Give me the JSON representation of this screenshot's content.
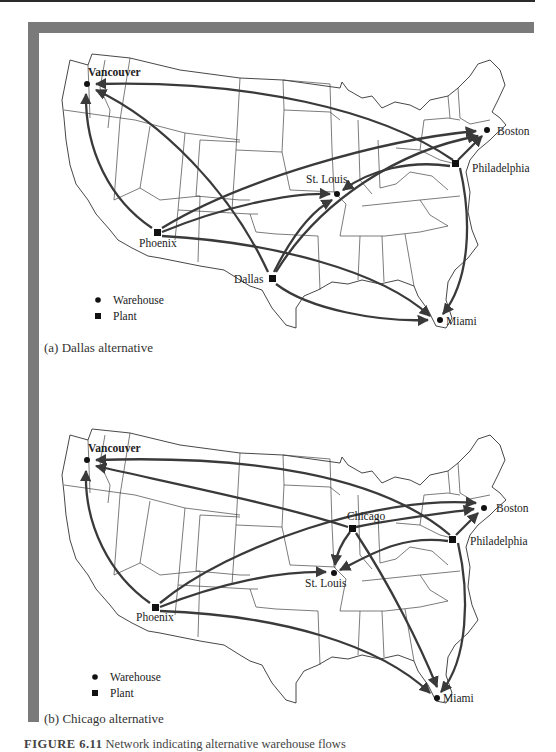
{
  "figure": {
    "number": "FIGURE 6.11",
    "caption_text": "Network indicating alternative warehouse flows"
  },
  "panels": [
    {
      "id": "a",
      "caption": "(a) Dallas alternative",
      "legend": [
        {
          "symbol": "circle",
          "label": "Warehouse"
        },
        {
          "symbol": "square",
          "label": "Plant"
        }
      ],
      "nodes": [
        {
          "name": "Vancouver",
          "type": "warehouse"
        },
        {
          "name": "Boston",
          "type": "warehouse"
        },
        {
          "name": "Philadelphia",
          "type": "plant"
        },
        {
          "name": "St. Louis",
          "type": "warehouse"
        },
        {
          "name": "Phoenix",
          "type": "plant"
        },
        {
          "name": "Dallas",
          "type": "plant"
        },
        {
          "name": "Miami",
          "type": "warehouse"
        }
      ],
      "flows": [
        {
          "from": "Philadelphia",
          "to": "Vancouver"
        },
        {
          "from": "Philadelphia",
          "to": "Boston"
        },
        {
          "from": "Philadelphia",
          "to": "St. Louis"
        },
        {
          "from": "Philadelphia",
          "to": "Miami"
        },
        {
          "from": "Phoenix",
          "to": "Vancouver"
        },
        {
          "from": "Phoenix",
          "to": "Boston"
        },
        {
          "from": "Phoenix",
          "to": "St. Louis"
        },
        {
          "from": "Phoenix",
          "to": "Miami"
        },
        {
          "from": "Dallas",
          "to": "Vancouver"
        },
        {
          "from": "Dallas",
          "to": "Boston"
        },
        {
          "from": "Dallas",
          "to": "St. Louis"
        },
        {
          "from": "Dallas",
          "to": "Miami"
        }
      ]
    },
    {
      "id": "b",
      "caption": "(b) Chicago alternative",
      "legend": [
        {
          "symbol": "circle",
          "label": "Warehouse"
        },
        {
          "symbol": "square",
          "label": "Plant"
        }
      ],
      "nodes": [
        {
          "name": "Vancouver",
          "type": "warehouse"
        },
        {
          "name": "Boston",
          "type": "warehouse"
        },
        {
          "name": "Philadelphia",
          "type": "plant"
        },
        {
          "name": "Chicago",
          "type": "plant"
        },
        {
          "name": "St. Louis",
          "type": "warehouse"
        },
        {
          "name": "Phoenix",
          "type": "plant"
        },
        {
          "name": "Miami",
          "type": "warehouse"
        }
      ],
      "flows": [
        {
          "from": "Philadelphia",
          "to": "Vancouver"
        },
        {
          "from": "Philadelphia",
          "to": "Boston"
        },
        {
          "from": "Philadelphia",
          "to": "St. Louis"
        },
        {
          "from": "Philadelphia",
          "to": "Miami"
        },
        {
          "from": "Chicago",
          "to": "Vancouver"
        },
        {
          "from": "Chicago",
          "to": "Boston"
        },
        {
          "from": "Chicago",
          "to": "St. Louis"
        },
        {
          "from": "Chicago",
          "to": "Miami"
        },
        {
          "from": "Phoenix",
          "to": "Vancouver"
        },
        {
          "from": "Phoenix",
          "to": "Boston"
        },
        {
          "from": "Phoenix",
          "to": "St. Louis"
        },
        {
          "from": "Phoenix",
          "to": "Miami"
        }
      ]
    }
  ],
  "colors": {
    "frame": "#7a7a7a",
    "flow": "#3a3a3a",
    "outline": "#333333"
  }
}
